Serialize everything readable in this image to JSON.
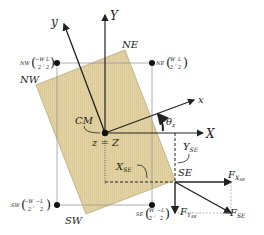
{
  "diagram": {
    "type": "rigid-body free body diagram (top view)",
    "colors": {
      "body_fill": "#e3d4a6",
      "body_stroke": "#b9a878",
      "axis": "#222222",
      "guide": "#9a9a9a",
      "dot": "#111111"
    },
    "axes": {
      "global_x": "X",
      "global_y": "Y",
      "body_x": "x",
      "body_y": "y",
      "angle": "θ",
      "angle_sub": "z",
      "origin": "z = Z"
    },
    "center_label": "CM",
    "corners": {
      "nw": {
        "label": "NW",
        "coord_prefix": "NW",
        "coord_w": "W",
        "coord_l": "L",
        "sign_w": "−",
        "sign_l": "",
        "den": "2"
      },
      "ne": {
        "label": "NE",
        "coord_prefix": "NE",
        "coord_w": "W",
        "coord_l": "L",
        "sign_w": "",
        "sign_l": "",
        "den": "2"
      },
      "sw": {
        "label": "SW",
        "coord_prefix": "SW",
        "coord_w": "W",
        "coord_l": "L",
        "sign_w": "−",
        "sign_l": "−",
        "den": "2"
      },
      "se": {
        "label": "SE",
        "coord_prefix": "SE",
        "coord_w": "W",
        "coord_l": "L",
        "sign_w": "",
        "sign_l": "−",
        "den": "2"
      }
    },
    "distances": {
      "x_se": "X",
      "x_se_sub": "SE",
      "y_se": "Y",
      "y_se_sub": "SE"
    },
    "forces": {
      "fx": "F",
      "fx_sub": "X",
      "fx_subsub": "SE",
      "fy": "F",
      "fy_sub": "Y",
      "fy_subsub": "SE",
      "f": "F",
      "f_sub": "SE"
    }
  }
}
